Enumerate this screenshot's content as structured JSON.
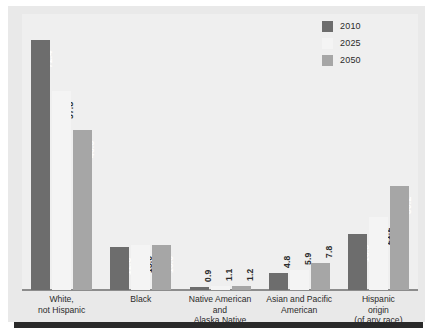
{
  "chart_data": {
    "type": "bar",
    "title": "",
    "subtitle": "",
    "xlabel": "",
    "ylabel": "",
    "ylim": [
      0,
      80
    ],
    "grid": false,
    "legend_position": "top-right",
    "value_label_format": "one-decimal, rotated 90 degrees",
    "categories": [
      "White,\nnot Hispanic",
      "Black",
      "Native American and\nAlaska Native",
      "Asian and Pacific\nAmerican",
      "Hispanic\norigin\n(of any race)"
    ],
    "category_lines": [
      [
        "White,",
        "not Hispanic"
      ],
      [
        "Black"
      ],
      [
        "Native American and",
        "Alaska Native"
      ],
      [
        "Asian and Pacific",
        "American"
      ],
      [
        "Hispanic",
        "origin",
        "(of any race)"
      ]
    ],
    "series": [
      {
        "name": "2010",
        "color": "#6d6d6d",
        "label_color": "#ffffff",
        "values": [
          72.4,
          12.6,
          0.9,
          4.8,
          16.3
        ]
      },
      {
        "name": "2025",
        "color": "#f4f4f4",
        "label_color": "#2b2b2b",
        "values": [
          57.8,
          13.0,
          1.1,
          5.9,
          21.2
        ]
      },
      {
        "name": "2050",
        "color": "#a6a6a6",
        "label_color": "#ffffff",
        "values": [
          46.3,
          13.0,
          1.2,
          7.8,
          30.2
        ]
      }
    ]
  },
  "legend": {
    "items": [
      {
        "label": "2010",
        "color": "#6d6d6d"
      },
      {
        "label": "2025",
        "color": "#f4f4f4"
      },
      {
        "label": "2050",
        "color": "#a6a6a6"
      }
    ]
  },
  "colors": {
    "page_background": "#ffffff",
    "card_background": "#e9e9e9",
    "plot_background": "#efefef",
    "axis_line": "#8c8c8c",
    "bottom_rule": "#2a2a2a",
    "text": "#2b2b2b"
  }
}
